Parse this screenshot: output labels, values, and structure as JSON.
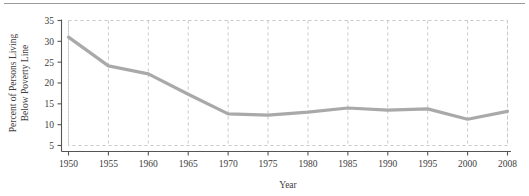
{
  "figure": {
    "has_top_rule": true,
    "background_color": "#ffffff"
  },
  "chart_data": {
    "type": "line",
    "title": "",
    "subtitle": "",
    "xlabel": "Year",
    "ylabel": "Percent of Persons Living Below Poverty Line",
    "ylabel_lines": [
      "Percent of Persons Living",
      "Below Poverty Line"
    ],
    "x": [
      1950,
      1955,
      1960,
      1965,
      1970,
      1975,
      1980,
      1985,
      1990,
      1995,
      2000,
      2008
    ],
    "categories": [
      "1950",
      "1955",
      "1960",
      "1965",
      "1970",
      "1975",
      "1980",
      "1985",
      "1990",
      "1995",
      "2000",
      "2008"
    ],
    "values": [
      31.0,
      24.1,
      22.2,
      17.3,
      12.6,
      12.3,
      13.0,
      14.0,
      13.5,
      13.8,
      11.3,
      13.2
    ],
    "series": [
      {
        "name": "Percent below poverty line",
        "values": [
          31.0,
          24.1,
          22.2,
          17.3,
          12.6,
          12.3,
          13.0,
          14.0,
          13.5,
          13.8,
          11.3,
          13.2
        ],
        "color": "#a9a9a9",
        "line_width": 3.2
      }
    ],
    "xticklabels": [
      "1950",
      "1955",
      "1960",
      "1965",
      "1970",
      "1975",
      "1980",
      "1985",
      "1990",
      "1995",
      "2000",
      "2008"
    ],
    "yticks": [
      5,
      10,
      15,
      20,
      25,
      30,
      35
    ],
    "yticklabels": [
      "5",
      "10",
      "15",
      "20",
      "25",
      "30",
      "35"
    ],
    "ylim": [
      5,
      35
    ],
    "xlim": [
      1950,
      2008
    ],
    "grid": true,
    "grid_style": "dashed",
    "grid_color": "#c8c8c8",
    "legend": false,
    "legend_position": "none",
    "axis_color": "#555555",
    "plot_box_style": "dashed"
  }
}
